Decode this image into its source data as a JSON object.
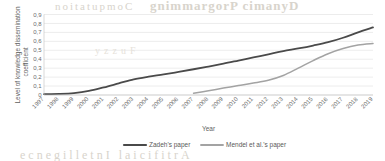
{
  "background_artifacts": {
    "top_right_text": "gnimmargorP cimanyD",
    "top_left_text": "noitatupmoC",
    "bottom_text": "ecnegilletnI laicifitrA",
    "middle_text": "yzzuF"
  },
  "colors": {
    "series_1": "#4a4a4a",
    "series_2": "#a3a3a3",
    "gridline": "#d9d9d9",
    "axis": "#bfbfbf",
    "tick_text": "#6b6b6b",
    "title_text": "#5f5f5f",
    "legend_text": "#595959",
    "plot_background": "#ffffff"
  },
  "chart_data": {
    "type": "line",
    "title": "",
    "xlabel": "Year",
    "ylabel": "Level of knowledge dissemination coefficient",
    "ylabel_lines": [
      "Level of knowledge dissemination",
      "coefficient"
    ],
    "ylim": [
      0,
      0.9
    ],
    "ytick_labels": [
      "0,9",
      "0,8",
      "0,7",
      "0,6",
      "0,5",
      "0,4",
      "0,3",
      "0,2",
      "0,1",
      "0"
    ],
    "ytick_values": [
      0.9,
      0.8,
      0.7,
      0.6,
      0.5,
      0.4,
      0.3,
      0.2,
      0.1,
      0
    ],
    "grid": true,
    "grid_axis": "y",
    "legend_position": "bottom",
    "x_tick_rotation": -45,
    "categories": [
      "1997",
      "1998",
      "1999",
      "2000",
      "2001",
      "2002",
      "2003",
      "2004",
      "2005",
      "2006",
      "2007",
      "2008",
      "2009",
      "2010",
      "2011",
      "2012",
      "2013",
      "2014",
      "2015",
      "2016",
      "2017",
      "2018",
      "2019"
    ],
    "series": [
      {
        "name": "Zadeh's paper",
        "color": "#4a4a4a",
        "width": 1.8,
        "values": [
          0.01,
          0.013,
          0.022,
          0.045,
          0.085,
          0.13,
          0.175,
          0.205,
          0.23,
          0.258,
          0.288,
          0.318,
          0.35,
          0.385,
          0.42,
          0.455,
          0.49,
          0.52,
          0.553,
          0.59,
          0.64,
          0.7,
          0.755
        ]
      },
      {
        "name": "Mendel et al.'s paper",
        "color": "#a3a3a3",
        "width": 1.5,
        "values": [
          null,
          null,
          null,
          null,
          null,
          null,
          null,
          null,
          null,
          null,
          0.02,
          0.048,
          0.077,
          0.105,
          0.133,
          0.165,
          0.218,
          0.3,
          0.385,
          0.462,
          0.52,
          0.558,
          0.575
        ]
      }
    ]
  }
}
